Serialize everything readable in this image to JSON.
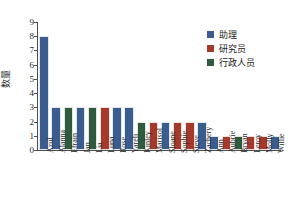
{
  "chart_data": {
    "type": "bar",
    "title": "",
    "xlabel": "",
    "ylabel": "数量",
    "ylim": [
      0,
      9
    ],
    "yticks": [
      0,
      1,
      2,
      3,
      4,
      5,
      6,
      7,
      8,
      9
    ],
    "grid": false,
    "legend_position": "upper right",
    "categories": [
      "Azul",
      "Alanna",
      "Efrain",
      "Jan",
      "Lia",
      "Luna",
      "Rose",
      "Yareli",
      "Kinley",
      "Marisol",
      "Sloane",
      "Sophie",
      "Steve",
      "Zachery",
      "Ann",
      "Aubrie",
      "Bryan",
      "Leroy",
      "Molly",
      "Willie"
    ],
    "values": [
      8,
      3,
      3,
      3,
      3,
      3,
      3,
      3,
      2,
      2,
      2,
      2,
      2,
      2,
      1,
      1,
      1,
      1,
      1,
      1
    ],
    "bar_groups": [
      "助理",
      "助理",
      "行政人员",
      "助理",
      "行政人员",
      "研究员",
      "助理",
      "助理",
      "行政人员",
      "研究员",
      "助理",
      "研究员",
      "研究员",
      "助理",
      "助理",
      "研究员",
      "行政人员",
      "研究员",
      "研究员",
      "助理"
    ],
    "series": [
      {
        "name": "助理",
        "color": "#3B5C8F"
      },
      {
        "name": "研究员",
        "color": "#A5392C"
      },
      {
        "name": "行政人员",
        "color": "#2F5A3D"
      }
    ]
  },
  "legend": {
    "items": [
      {
        "label": "助理",
        "color": "#3B5C8F"
      },
      {
        "label": "研究员",
        "color": "#A5392C"
      },
      {
        "label": "行政人员",
        "color": "#2F5A3D"
      }
    ]
  },
  "axes": {
    "y_title": "数量",
    "y_ticks": [
      "0",
      "1",
      "2",
      "3",
      "4",
      "5",
      "6",
      "7",
      "8",
      "9"
    ],
    "x_ticks": [
      "Azul",
      "Alanna",
      "Efrain",
      "Jan",
      "Lia",
      "Luna",
      "Rose",
      "Yareli",
      "Kinley",
      "Marisol",
      "Sloane",
      "Sophie",
      "Steve",
      "Zachery",
      "Ann",
      "Aubrie",
      "Bryan",
      "Leroy",
      "Molly",
      "Willie"
    ]
  },
  "colors": {
    "assistant": "#3B5C8F",
    "researcher": "#A5392C",
    "admin": "#2F5A3D",
    "axis": "#4d4d4d",
    "text": "#2b2b2b",
    "background": "#ffffff"
  }
}
